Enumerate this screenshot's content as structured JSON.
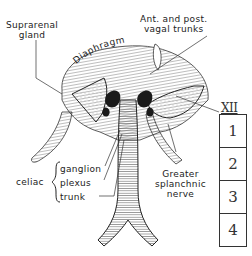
{
  "labels": {
    "suprarenal": [
      "Suprarenal",
      "gland"
    ],
    "vagal": [
      "Ant. and post.",
      "vagal trunks"
    ],
    "diaphragm": "Diaphragm",
    "celiac": "celiac",
    "celiac_parts": [
      "ganglion",
      "plexus",
      "trunk"
    ],
    "splanchnic": [
      "Greater",
      "splanchnic",
      "nerve"
    ]
  },
  "vertebrae": {
    "top": "XII",
    "lumbar": [
      "1",
      "2",
      "3",
      "4"
    ]
  },
  "colors": {
    "ink": "#222222",
    "background": "#ffffff"
  }
}
